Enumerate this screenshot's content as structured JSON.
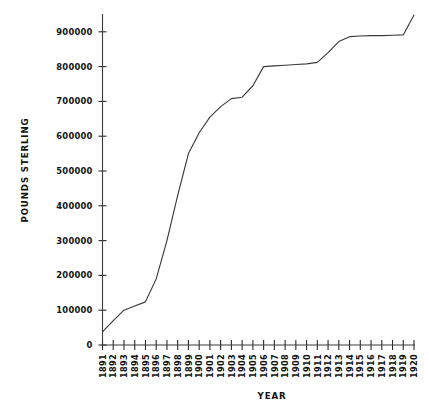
{
  "chart_data": {
    "type": "line",
    "title": "",
    "xlabel": "YEAR",
    "ylabel": "POUNDS STERLING",
    "grid": false,
    "legend": "none",
    "xlim": [
      1891,
      1920
    ],
    "ylim": [
      0,
      950000
    ],
    "y_ticks": [
      0,
      100000,
      200000,
      300000,
      400000,
      500000,
      600000,
      700000,
      800000,
      900000
    ],
    "y_tick_labels": [
      "0",
      "100000",
      "200000",
      "300000",
      "400000",
      "500000",
      "600000",
      "700000",
      "800000",
      "900000"
    ],
    "categories": [
      "1891",
      "1892",
      "1893",
      "1894",
      "1895",
      "1896",
      "1897",
      "1898",
      "1899",
      "1900",
      "1901",
      "1902",
      "1903",
      "1904",
      "1905",
      "1906",
      "1907",
      "1908",
      "1909",
      "1910",
      "1911",
      "1912",
      "1913",
      "1914",
      "1915",
      "1916",
      "1917",
      "1918",
      "1919",
      "1920"
    ],
    "x": [
      1891,
      1892,
      1893,
      1894,
      1895,
      1896,
      1897,
      1898,
      1899,
      1900,
      1901,
      1902,
      1903,
      1904,
      1905,
      1906,
      1907,
      1908,
      1909,
      1910,
      1911,
      1912,
      1913,
      1914,
      1915,
      1916,
      1917,
      1918,
      1919,
      1920
    ],
    "values": [
      38000,
      70000,
      100000,
      112000,
      124000,
      190000,
      300000,
      430000,
      550000,
      610000,
      655000,
      685000,
      708000,
      712000,
      745000,
      800000,
      802000,
      804000,
      806000,
      808000,
      812000,
      840000,
      872000,
      886000,
      888000,
      889000,
      889000,
      890000,
      891000,
      948000
    ],
    "series_name": "Pounds Sterling"
  },
  "axis_titles": {
    "x": "YEAR",
    "y": "POUNDS STERLING"
  },
  "colors": {
    "line": "#3b3b3b",
    "axis": "#3a3a3a",
    "text": "#121212",
    "background": "#ffffff"
  }
}
